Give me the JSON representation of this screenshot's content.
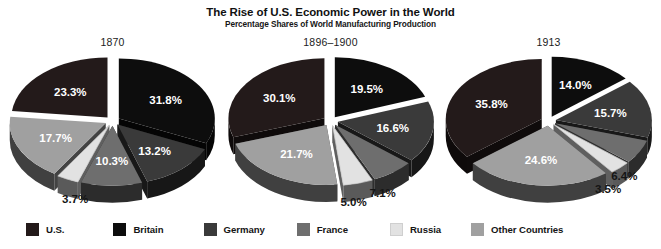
{
  "header": {
    "title": "The Rise of U.S. Economic Power in the World",
    "subtitle": "Percentage Shares of World Manufacturing Production"
  },
  "legend": {
    "items": [
      {
        "label": "U.S.",
        "color": "#231a1a"
      },
      {
        "label": "Britain",
        "color": "#0d0d0d"
      },
      {
        "label": "Germany",
        "color": "#3a3a3a"
      },
      {
        "label": "France",
        "color": "#6e6e6e"
      },
      {
        "label": "Russia",
        "color": "#e2e2e2"
      },
      {
        "label": "Other Countries",
        "color": "#a0a0a0"
      }
    ]
  },
  "panels": [
    {
      "year": "1870",
      "labels": [
        "23.3%",
        "31.8%",
        "13.2%",
        "10.3%",
        "3.7%",
        "17.7%"
      ]
    },
    {
      "year": "1896–1900",
      "labels": [
        "30.1%",
        "19.5%",
        "16.6%",
        "7.1%",
        "5.0%",
        "21.7%"
      ]
    },
    {
      "year": "1913",
      "labels": [
        "35.8%",
        "14.0%",
        "15.7%",
        "6.4%",
        "3.5%",
        "24.6%"
      ]
    }
  ],
  "chart_data": {
    "type": "pie",
    "title": "The Rise of U.S. Economic Power in the World",
    "subtitle": "Percentage Shares of World Manufacturing Production",
    "ylabel": "",
    "xlabel": "",
    "grid": false,
    "legend_position": "bottom",
    "units": "percent",
    "categories": [
      "U.S.",
      "Britain",
      "Germany",
      "France",
      "Russia",
      "Other Countries"
    ],
    "category_colors": [
      "#231a1a",
      "#0d0d0d",
      "#3a3a3a",
      "#6e6e6e",
      "#e2e2e2",
      "#a0a0a0"
    ],
    "charts": [
      {
        "title": "1870",
        "values": [
          23.3,
          31.8,
          13.2,
          10.3,
          3.7,
          17.7
        ],
        "labels": [
          "23.3%",
          "31.8%",
          "13.2%",
          "10.3%",
          "3.7%",
          "17.7%"
        ]
      },
      {
        "title": "1896–1900",
        "values": [
          30.1,
          19.5,
          16.6,
          7.1,
          5.0,
          21.7
        ],
        "labels": [
          "30.1%",
          "19.5%",
          "16.6%",
          "7.1%",
          "5.0%",
          "21.7%"
        ]
      },
      {
        "title": "1913",
        "values": [
          35.8,
          14.0,
          15.7,
          6.4,
          3.5,
          24.6
        ],
        "labels": [
          "35.8%",
          "14.0%",
          "15.7%",
          "6.4%",
          "3.5%",
          "24.6%"
        ]
      }
    ],
    "series": [
      {
        "name": "1870",
        "values": [
          23.3,
          31.8,
          13.2,
          10.3,
          3.7,
          17.7
        ]
      },
      {
        "name": "1896–1900",
        "values": [
          30.1,
          19.5,
          16.6,
          7.1,
          5.0,
          21.7
        ]
      },
      {
        "name": "1913",
        "values": [
          35.8,
          14.0,
          15.7,
          6.4,
          3.5,
          24.6
        ]
      }
    ]
  }
}
